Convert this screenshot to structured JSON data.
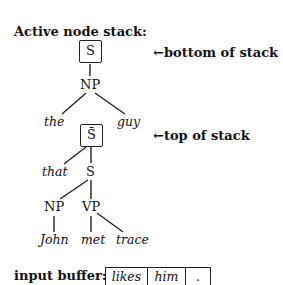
{
  "title": "Active node stack:",
  "annotations": {
    "bottom": "←bottom of stack",
    "top": "←top of stack"
  },
  "stack": {
    "bottom_node": {
      "label": "S",
      "child": "NP",
      "leaves": [
        "the",
        "guy"
      ]
    },
    "top_node": {
      "label": "S̄",
      "children": [
        "that",
        "S"
      ],
      "S_children": [
        "NP",
        "VP"
      ],
      "NP_child": "John",
      "VP_children": [
        "met",
        "trace"
      ]
    }
  },
  "input_buffer": {
    "label": "input buffer:",
    "cells": [
      "likes",
      "him",
      "."
    ]
  }
}
